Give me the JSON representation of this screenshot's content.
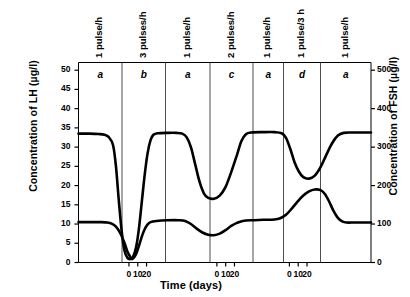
{
  "chart_data": {
    "type": "line",
    "title": "",
    "xlabel": "Time (days)",
    "ylabel": "Concentration of LH (µg/l)",
    "y2label": "Concentration of FSH (µg/l)",
    "xlim": [
      0,
      203
    ],
    "ylim": [
      0,
      52
    ],
    "y2lim": [
      0,
      520
    ],
    "grid": false,
    "legend_position": "none",
    "y_ticks": [
      0,
      5,
      10,
      15,
      20,
      25,
      30,
      35,
      40,
      45,
      50
    ],
    "y_tick_labels": [
      "0",
      "5",
      "10",
      "15",
      "20",
      "25",
      "30",
      "35",
      "40",
      "45",
      "50"
    ],
    "y2_ticks": [
      0,
      100,
      200,
      300,
      400,
      500
    ],
    "y2_tick_labels": [
      "0",
      "100",
      "200",
      "300",
      "400",
      "500"
    ],
    "x_tick_groups": [
      {
        "panel_index": 1,
        "ticks": [
          0,
          10,
          20
        ],
        "labels": [
          "0",
          "10",
          "20"
        ]
      },
      {
        "panel_index": 3,
        "ticks": [
          0,
          10,
          20
        ],
        "labels": [
          "0",
          "10",
          "20"
        ]
      },
      {
        "panel_index": 5,
        "ticks": [
          0,
          10,
          20
        ],
        "labels": [
          "0",
          "10",
          "20"
        ]
      }
    ],
    "panels": [
      {
        "letter": "a",
        "header": "1 pulse/h"
      },
      {
        "letter": "b",
        "header": "3 pulses/h"
      },
      {
        "letter": "a",
        "header": "1 pulse/h"
      },
      {
        "letter": "c",
        "header": "2 pulses/h"
      },
      {
        "letter": "a",
        "header": "1 pulse/h"
      },
      {
        "letter": "d",
        "header": "1 pulse/3 h"
      },
      {
        "letter": "a",
        "header": "1 pulse/h"
      }
    ],
    "series": [
      {
        "name": "LH",
        "axis": "left",
        "units": "µg/l",
        "baseline": 33.5,
        "points": [
          [
            0,
            33.5
          ],
          [
            8,
            33.5
          ],
          [
            14,
            33.4
          ],
          [
            18,
            33.2
          ],
          [
            21,
            32.6
          ],
          [
            24,
            30.5
          ],
          [
            26,
            25.0
          ],
          [
            28,
            16.0
          ],
          [
            30,
            8.0
          ],
          [
            32,
            3.0
          ],
          [
            34,
            1.2
          ],
          [
            36,
            0.9
          ],
          [
            38,
            1.6
          ],
          [
            40,
            4.0
          ],
          [
            42,
            9.0
          ],
          [
            44,
            16.0
          ],
          [
            46,
            23.0
          ],
          [
            48,
            28.5
          ],
          [
            50,
            31.8
          ],
          [
            52,
            33.2
          ],
          [
            55,
            33.6
          ],
          [
            62,
            33.7
          ],
          [
            68,
            33.7
          ],
          [
            72,
            33.5
          ],
          [
            75,
            32.6
          ],
          [
            78,
            30.0
          ],
          [
            81,
            25.5
          ],
          [
            84,
            21.0
          ],
          [
            87,
            18.0
          ],
          [
            90,
            16.8
          ],
          [
            94,
            16.6
          ],
          [
            98,
            17.4
          ],
          [
            102,
            19.6
          ],
          [
            106,
            23.5
          ],
          [
            110,
            28.0
          ],
          [
            113,
            31.5
          ],
          [
            116,
            33.3
          ],
          [
            120,
            33.8
          ],
          [
            128,
            33.9
          ],
          [
            136,
            33.9
          ],
          [
            141,
            33.6
          ],
          [
            144,
            32.4
          ],
          [
            147,
            29.5
          ],
          [
            150,
            26.0
          ],
          [
            153,
            23.6
          ],
          [
            156,
            22.2
          ],
          [
            160,
            21.8
          ],
          [
            164,
            22.6
          ],
          [
            168,
            24.8
          ],
          [
            172,
            28.0
          ],
          [
            176,
            31.0
          ],
          [
            180,
            33.0
          ],
          [
            184,
            33.7
          ],
          [
            190,
            33.8
          ],
          [
            203,
            33.8
          ]
        ]
      },
      {
        "name": "FSH",
        "axis": "right",
        "units": "µg/l",
        "baseline": 105,
        "points": [
          [
            0,
            105
          ],
          [
            10,
            105
          ],
          [
            16,
            105
          ],
          [
            20,
            104
          ],
          [
            23,
            101
          ],
          [
            26,
            93
          ],
          [
            29,
            76
          ],
          [
            32,
            50
          ],
          [
            34,
            28
          ],
          [
            36,
            14
          ],
          [
            37,
            9
          ],
          [
            38,
            11
          ],
          [
            40,
            22
          ],
          [
            42,
            44
          ],
          [
            44,
            68
          ],
          [
            46,
            87
          ],
          [
            48,
            99
          ],
          [
            50,
            105
          ],
          [
            54,
            108
          ],
          [
            62,
            110
          ],
          [
            70,
            110
          ],
          [
            74,
            108
          ],
          [
            78,
            100
          ],
          [
            82,
            88
          ],
          [
            86,
            78
          ],
          [
            90,
            72
          ],
          [
            94,
            71
          ],
          [
            98,
            75
          ],
          [
            102,
            84
          ],
          [
            106,
            95
          ],
          [
            110,
            103
          ],
          [
            114,
            108
          ],
          [
            120,
            110
          ],
          [
            128,
            111
          ],
          [
            136,
            112
          ],
          [
            140,
            115
          ],
          [
            144,
            124
          ],
          [
            148,
            140
          ],
          [
            152,
            158
          ],
          [
            156,
            174
          ],
          [
            160,
            185
          ],
          [
            164,
            190
          ],
          [
            168,
            188
          ],
          [
            171,
            178
          ],
          [
            174,
            158
          ],
          [
            177,
            134
          ],
          [
            180,
            116
          ],
          [
            183,
            107
          ],
          [
            186,
            104
          ],
          [
            192,
            104
          ],
          [
            203,
            104
          ]
        ]
      }
    ]
  },
  "axes": {
    "y_left_title": "Concentration of LH (µg/l)",
    "y_right_title": "Concentration of FSH (µg/l)",
    "x_title": "Time (days)"
  }
}
